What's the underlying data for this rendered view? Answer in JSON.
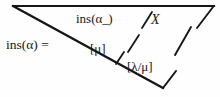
{
  "figure": {
    "background_color": "#fefefe",
    "ink_color": "#161616",
    "labels": {
      "lhs": "ins(α) =",
      "top_cell": "ins(α",
      "top_cell_sub": "_)",
      "x_label": "X",
      "mu_label": "[μ]",
      "lambda_mu_label": "[λ/μ]"
    },
    "strokes": {
      "top_edge": "horizontal line from apex to right edge",
      "hypotenuse": "long diagonal from top-left apex down to lower right",
      "bottom_kick": "short upward segment at lower right vertex",
      "tick_mu": "short tick branching from hypotenuse near [μ]",
      "slashes": "four slanted tick marks separating cells"
    }
  }
}
